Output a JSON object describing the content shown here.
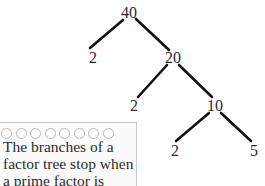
{
  "tree": {
    "nodes": [
      {
        "id": "n40",
        "label": "40",
        "x": 129,
        "y": 13
      },
      {
        "id": "n2a",
        "label": "2",
        "x": 93,
        "y": 58
      },
      {
        "id": "n20",
        "label": "20",
        "x": 173,
        "y": 58
      },
      {
        "id": "n2b",
        "label": "2",
        "x": 134,
        "y": 106
      },
      {
        "id": "n10",
        "label": "10",
        "x": 215,
        "y": 106
      },
      {
        "id": "n2c",
        "label": "2",
        "x": 175,
        "y": 151
      },
      {
        "id": "n5",
        "label": "5",
        "x": 254,
        "y": 151
      }
    ],
    "edges": [
      {
        "from": "40",
        "to": "2"
      },
      {
        "from": "40",
        "to": "20"
      },
      {
        "from": "20",
        "to": "2"
      },
      {
        "from": "20",
        "to": "10"
      },
      {
        "from": "10",
        "to": "2"
      },
      {
        "from": "10",
        "to": "5"
      }
    ],
    "line_color": "#111111"
  },
  "note": {
    "ring_count": 8,
    "lines": [
      "The branches of a",
      "factor tree stop when",
      "a prime factor is"
    ]
  }
}
